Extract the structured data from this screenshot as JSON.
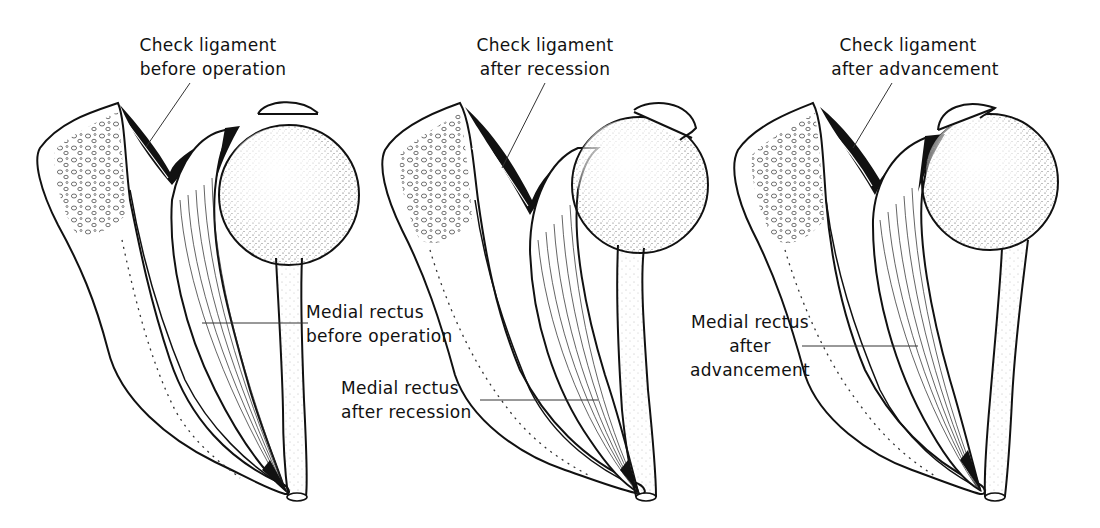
{
  "figure": {
    "type": "anatomical-diagram",
    "panels": [
      {
        "id": "before",
        "check_ligament_label": [
          "Check ligament",
          "before operation"
        ],
        "muscle_label": [
          "Medial rectus",
          "before operation"
        ]
      },
      {
        "id": "recession",
        "check_ligament_label": [
          "Check ligament",
          "after recession"
        ],
        "muscle_label": [
          "Medial rectus",
          "after recession"
        ]
      },
      {
        "id": "advancement",
        "check_ligament_label": [
          "Check ligament",
          "after advancement"
        ],
        "muscle_label": [
          "Medial rectus",
          "after",
          "advancement"
        ]
      }
    ]
  },
  "colors": {
    "ink": "#111111",
    "background": "#ffffff",
    "stipple": "#555555"
  }
}
